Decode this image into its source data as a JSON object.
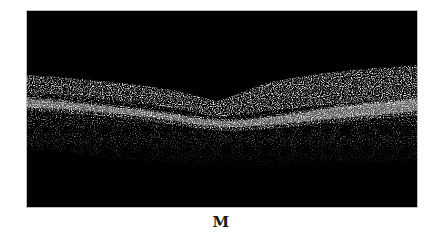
{
  "figure": {
    "panel_label": "M",
    "image_description": "OCT B-scan cross-section of retina with foveal depression",
    "colors": {
      "background": "#000000",
      "tissue_bright": "#d8d8d8",
      "tissue_mid": "#9a9a9a",
      "page": "#ffffff"
    }
  }
}
